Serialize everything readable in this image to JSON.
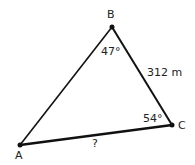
{
  "diagram": {
    "type": "triangle",
    "vertices": [
      {
        "id": "A",
        "label": "A",
        "x": 20,
        "y": 145
      },
      {
        "id": "B",
        "label": "B",
        "x": 112,
        "y": 27
      },
      {
        "id": "C",
        "label": "C",
        "x": 172,
        "y": 125
      }
    ],
    "angles": {
      "B": "47°",
      "C": "54°"
    },
    "sides": {
      "BC": "312 m",
      "AC": "?"
    },
    "colors": {
      "line": "#111111",
      "text": "#222222"
    }
  }
}
